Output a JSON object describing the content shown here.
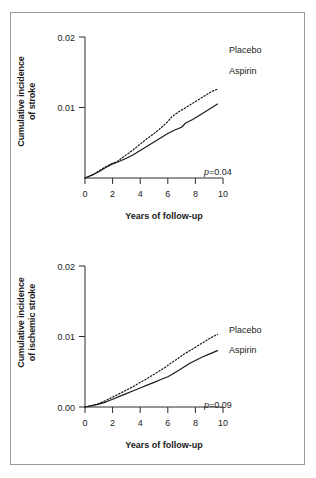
{
  "figure": {
    "border_color": "#9a9a9a",
    "background": "#ffffff"
  },
  "chart_data": [
    {
      "type": "line",
      "panel": "top",
      "title": "",
      "xlabel": "Years of follow-up",
      "ylabel": "Cumulative incidence of stroke",
      "ylabel_line1": "Cumulative incidence",
      "ylabel_line2": "of stroke",
      "xlim": [
        0,
        10
      ],
      "ylim": [
        0,
        0.02
      ],
      "xticks": [
        0,
        2,
        4,
        6,
        8,
        10
      ],
      "xticklabels": [
        "0",
        "2",
        "4",
        "6",
        "8",
        "10"
      ],
      "yticks": [
        0.01,
        0.02
      ],
      "yticklabels": [
        "0.01",
        "0.02"
      ],
      "grid": false,
      "legend_position": "inline-right-of-curve-ends",
      "annotation_p": "0.09_placeholder",
      "annotations": [
        {
          "name": "p-value",
          "prefix": "p",
          "text": "=0.04",
          "value": 0.04
        }
      ],
      "series": [
        {
          "name": "Placebo",
          "style": "dotted",
          "x": [
            0,
            0.5,
            1.0,
            1.5,
            2.0,
            2.3,
            3.0,
            3.5,
            4.0,
            4.5,
            5.0,
            5.5,
            6.0,
            6.3,
            6.8,
            7.3,
            7.8,
            8.3,
            8.8,
            9.2,
            9.6
          ],
          "values": [
            0.0,
            0.0004,
            0.001,
            0.0016,
            0.0021,
            0.0023,
            0.0033,
            0.004,
            0.0048,
            0.0056,
            0.0063,
            0.0071,
            0.008,
            0.0087,
            0.0094,
            0.01,
            0.0106,
            0.0112,
            0.0118,
            0.0123,
            0.0126
          ],
          "end_value": 0.0126
        },
        {
          "name": "Aspirin",
          "style": "solid",
          "x": [
            0,
            0.5,
            1.0,
            1.5,
            2.0,
            2.3,
            3.0,
            3.5,
            4.0,
            4.5,
            5.0,
            5.5,
            6.0,
            6.5,
            7.0,
            7.3,
            7.8,
            8.3,
            8.8,
            9.2,
            9.6
          ],
          "values": [
            0.0,
            0.0004,
            0.0009,
            0.0015,
            0.002,
            0.0022,
            0.0028,
            0.0033,
            0.0039,
            0.0045,
            0.0051,
            0.0057,
            0.0063,
            0.0068,
            0.0072,
            0.0078,
            0.0083,
            0.0089,
            0.0095,
            0.01,
            0.0105
          ],
          "end_value": 0.0105
        }
      ]
    },
    {
      "type": "line",
      "panel": "bottom",
      "title": "",
      "xlabel": "Years of follow-up",
      "ylabel": "Cumulative incidence of ischemic stroke",
      "ylabel_line1": "Cumulative incidence",
      "ylabel_line2": "of ischemic stroke",
      "xlim": [
        0,
        10
      ],
      "ylim": [
        0,
        0.02
      ],
      "xticks": [
        0,
        2,
        4,
        6,
        8,
        10
      ],
      "xticklabels": [
        "0",
        "2",
        "4",
        "6",
        "8",
        "10"
      ],
      "yticks": [
        0.0,
        0.01,
        0.02
      ],
      "yticklabels": [
        "0.00",
        "0.01",
        "0.02"
      ],
      "grid": false,
      "legend_position": "inline-right-of-curve-ends",
      "annotations": [
        {
          "name": "p-value",
          "prefix": "p",
          "text": "=0.09",
          "value": 0.09
        }
      ],
      "series": [
        {
          "name": "Placebo",
          "style": "dotted",
          "x": [
            0,
            0.5,
            1.0,
            1.5,
            2.0,
            2.5,
            3.0,
            3.5,
            4.0,
            4.3,
            4.8,
            5.3,
            5.8,
            6.2,
            6.6,
            7.1,
            7.6,
            8.1,
            8.6,
            9.1,
            9.6
          ],
          "values": [
            0.0,
            0.0002,
            0.0005,
            0.0009,
            0.0014,
            0.0019,
            0.0024,
            0.0029,
            0.0035,
            0.0038,
            0.0044,
            0.005,
            0.0056,
            0.0062,
            0.0067,
            0.0074,
            0.008,
            0.0086,
            0.0092,
            0.0098,
            0.0103
          ],
          "end_value": 0.0103
        },
        {
          "name": "Aspirin",
          "style": "solid",
          "x": [
            0,
            0.5,
            1.0,
            1.5,
            2.0,
            2.5,
            3.0,
            3.5,
            4.0,
            4.5,
            5.0,
            5.5,
            6.0,
            6.3,
            6.8,
            7.2,
            7.6,
            8.0,
            8.5,
            9.0,
            9.6
          ],
          "values": [
            0.0,
            0.0002,
            0.0004,
            0.0007,
            0.0011,
            0.0015,
            0.0019,
            0.0023,
            0.0027,
            0.0031,
            0.0035,
            0.0039,
            0.0043,
            0.0046,
            0.0052,
            0.0057,
            0.0062,
            0.0066,
            0.0071,
            0.0075,
            0.008
          ],
          "end_value": 0.008
        }
      ]
    }
  ],
  "panels": {
    "top": {
      "ylabel_line1": "Cumulative incidence",
      "ylabel_line2": "of stroke",
      "xlabel": "Years of follow-up",
      "yticklabels": [
        "0.02",
        "0.01"
      ],
      "xticklabels": [
        "0",
        "2",
        "4",
        "6",
        "8",
        "10"
      ],
      "p_prefix": "p",
      "p_text": "=0.04",
      "series_placebo": "Placebo",
      "series_aspirin": "Aspirin"
    },
    "bottom": {
      "ylabel_line1": "Cumulative incidence",
      "ylabel_line2": "of ischemic stroke",
      "xlabel": "Years of follow-up",
      "yticklabels": [
        "0.02",
        "0.01",
        "0.00"
      ],
      "xticklabels": [
        "0",
        "2",
        "4",
        "6",
        "8",
        "10"
      ],
      "p_prefix": "p",
      "p_text": "=0.09",
      "series_placebo": "Placebo",
      "series_aspirin": "Aspirin"
    }
  }
}
